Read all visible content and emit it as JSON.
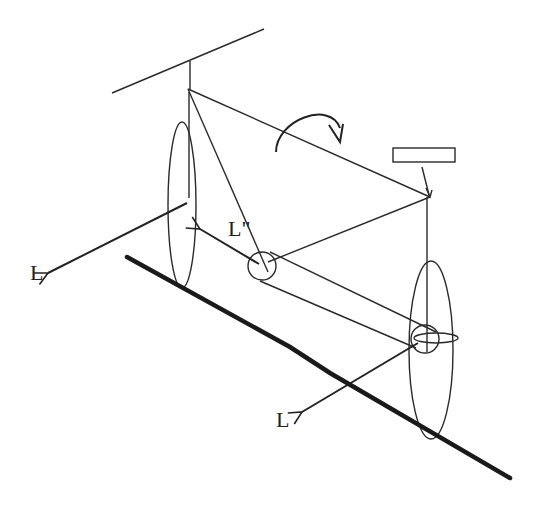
{
  "figure": {
    "type": "physics-schematic",
    "labels": {
      "front_wheel_L": "L",
      "handlebar_Lpp": "L\"",
      "rear_wheel_L": "L"
    },
    "elements": [
      "ceiling-line",
      "rotation-arrow",
      "handlebar-rectangle",
      "front-wheel",
      "rear-wheel",
      "crank-circle",
      "rear-hub-circle",
      "ground-line"
    ],
    "colors": {
      "stroke": "#222222",
      "background": "#ffffff"
    }
  }
}
